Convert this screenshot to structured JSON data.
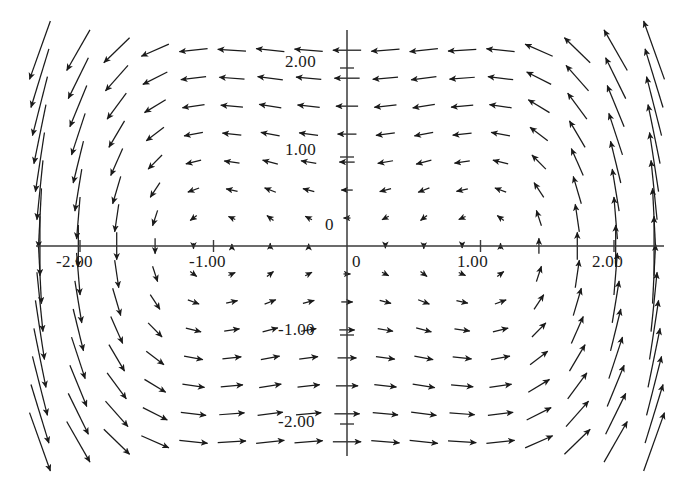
{
  "chart_data": {
    "type": "scatter",
    "subtype": "quiver-vector-field",
    "title": "",
    "subtitle": "",
    "xlabel": "",
    "ylabel": "",
    "xlim": [
      -2.45,
      2.45
    ],
    "ylim": [
      -2.35,
      2.35
    ],
    "grid": false,
    "legend": false,
    "legend_position": "none",
    "axis_color": "#3a3a3a",
    "arrow_color": "#1a1a1a",
    "background_color": "#ffffff",
    "field_formula": "F(x,y) = ( -y , x*(x*x - 1)/1.6 )",
    "vortex_centers": [
      {
        "x": -1.0,
        "y": 0.0,
        "rotation": "counterclockwise"
      },
      {
        "x": 1.0,
        "y": 0.0,
        "rotation": "clockwise"
      }
    ],
    "grid_spec": {
      "x_start": -2.3,
      "x_end": 2.3,
      "x_count": 17,
      "y_start": -2.2,
      "y_end": 2.2,
      "y_count": 15
    },
    "xticks": [
      -2,
      -1,
      0,
      1,
      2
    ],
    "yticks": [
      -2,
      -1,
      0,
      1,
      2
    ],
    "xtick_labels": [
      "-2.00",
      "-1.00",
      "0",
      "1.00",
      "2.00"
    ],
    "ytick_labels": [
      "-2.00",
      "-1.00",
      "0",
      "1.00",
      "2.00"
    ],
    "annotations": []
  },
  "axes": {
    "x_axis_name": "horizontal-axis",
    "y_axis_name": "vertical-axis",
    "x_labels": [
      {
        "text": "-2.00",
        "value": -2,
        "left": 56,
        "top": 252
      },
      {
        "text": "-1.00",
        "value": -1,
        "left": 189,
        "top": 252
      },
      {
        "text": "0",
        "value": 0,
        "left": 352,
        "top": 252
      },
      {
        "text": "1.00",
        "value": 1,
        "left": 457,
        "top": 252
      },
      {
        "text": "2.00",
        "value": 2,
        "left": 592,
        "top": 252
      }
    ],
    "y_labels": [
      {
        "text": "2.00",
        "value": 2,
        "left": 285,
        "top": 52
      },
      {
        "text": "1.00",
        "value": 1,
        "left": 285,
        "top": 140
      },
      {
        "text": "0",
        "value": 0,
        "left": 325,
        "top": 215
      },
      {
        "text": "-1.00",
        "value": -1,
        "left": 278,
        "top": 320
      },
      {
        "text": "-2.00",
        "value": -2,
        "left": 278,
        "top": 412
      }
    ]
  }
}
